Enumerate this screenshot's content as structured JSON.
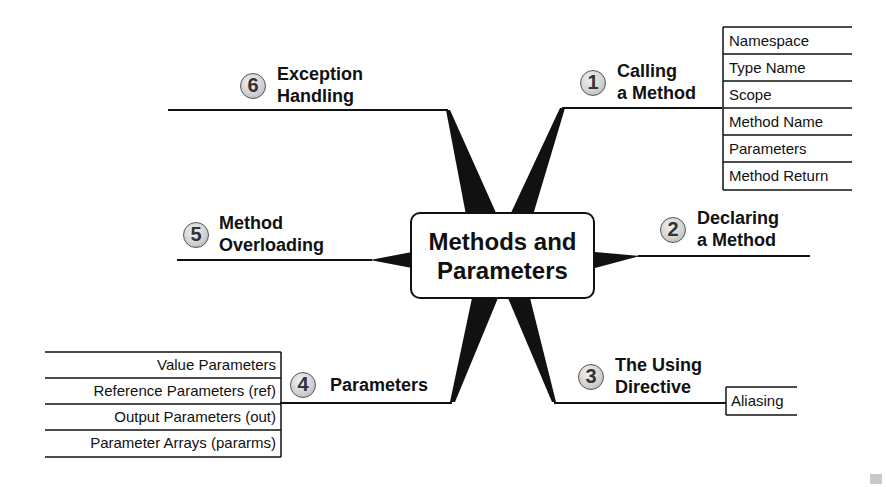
{
  "center": {
    "line1": "Methods and",
    "line2": "Parameters"
  },
  "branches": [
    {
      "number": "1",
      "label_line1": "Calling",
      "label_line2": "a Method",
      "sub_items": [
        "Namespace",
        "Type Name",
        "Scope",
        "Method Name",
        "Parameters",
        "Method Return"
      ]
    },
    {
      "number": "2",
      "label_line1": "Declaring",
      "label_line2": "a Method",
      "sub_items": []
    },
    {
      "number": "3",
      "label_line1": "The Using",
      "label_line2": "Directive",
      "sub_items": [
        "Aliasing"
      ]
    },
    {
      "number": "4",
      "label_line1": "Parameters",
      "label_line2": "",
      "sub_items": [
        "Value Parameters",
        "Reference Parameters (ref)",
        "Output Parameters (out)",
        "Parameter Arrays (pararms)"
      ]
    },
    {
      "number": "5",
      "label_line1": "Method",
      "label_line2": "Overloading",
      "sub_items": []
    },
    {
      "number": "6",
      "label_line1": "Exception",
      "label_line2": "Handling",
      "sub_items": []
    }
  ],
  "colors": {
    "line": "#111111",
    "badge_fill": "#cfcfcf",
    "background": "#ffffff"
  }
}
